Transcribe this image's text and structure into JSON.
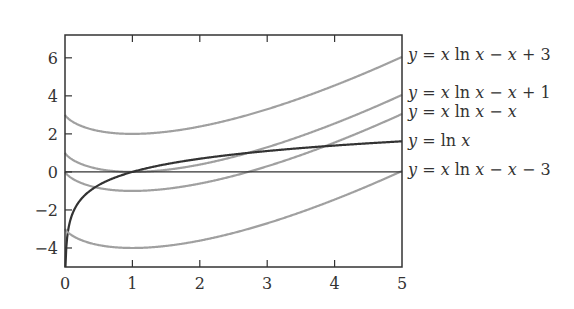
{
  "chart_data": {
    "type": "line",
    "title": "",
    "xlabel": "",
    "ylabel": "",
    "xlim": [
      0,
      5
    ],
    "ylim": [
      -5,
      7.2
    ],
    "xticks": [
      0,
      1,
      2,
      3,
      4,
      5
    ],
    "yticks": [
      -4,
      -2,
      0,
      2,
      4,
      6
    ],
    "xtick_labels": [
      "0",
      "1",
      "2",
      "3",
      "4",
      "5"
    ],
    "ytick_labels": [
      "−4",
      "−2",
      "0",
      "2",
      "4",
      "6"
    ],
    "grid": false,
    "legend_position": "right, inline labels at x=5",
    "series": [
      {
        "name": "y = x ln x − x + 3",
        "color": "#a0a0a0",
        "expr": "x*ln(x)-x+3",
        "x": [
          0,
          0.5,
          1,
          2,
          3,
          4,
          5
        ],
        "values": [
          3,
          2.15,
          2,
          1.39,
          2.3,
          4.55,
          6.05
        ]
      },
      {
        "name": "y = x ln x − x + 1",
        "color": "#a0a0a0",
        "expr": "x*ln(x)-x+1",
        "x": [
          0,
          0.5,
          1,
          2,
          3,
          4,
          5
        ],
        "values": [
          1,
          0.15,
          0,
          -0.61,
          0.3,
          2.55,
          4.05
        ]
      },
      {
        "name": "y = x ln x − x",
        "color": "#a0a0a0",
        "expr": "x*ln(x)-x",
        "x": [
          0,
          0.5,
          1,
          2,
          3,
          4,
          5
        ],
        "values": [
          0,
          -0.85,
          -1,
          -0.61,
          0.3,
          1.55,
          3.05
        ]
      },
      {
        "name": "y = ln x",
        "color": "#333333",
        "expr": "ln(x)",
        "x": [
          0.007,
          0.5,
          1,
          2,
          3,
          4,
          5
        ],
        "values": [
          -5,
          -0.69,
          0,
          0.69,
          1.1,
          1.39,
          1.61
        ]
      },
      {
        "name": "y = x ln x − x − 3",
        "color": "#a0a0a0",
        "expr": "x*ln(x)-x-3",
        "x": [
          0,
          0.5,
          1,
          2,
          3,
          4,
          5
        ],
        "values": [
          -3,
          -3.85,
          -4,
          -3.61,
          -2.7,
          -1.45,
          0.05
        ]
      },
      {
        "name": "y = 0",
        "color": "#333333",
        "expr": "0",
        "x": [
          0,
          5
        ],
        "values": [
          0,
          0
        ]
      }
    ],
    "labels": [
      {
        "text_parts": [
          "y",
          " = ",
          "x",
          " ln ",
          "x",
          " − ",
          "x",
          " + 3"
        ],
        "y_at": 6.05
      },
      {
        "text_parts": [
          "y",
          " = ",
          "x",
          " ln ",
          "x",
          " − ",
          "x",
          " + 1"
        ],
        "y_at": 4.05
      },
      {
        "text_parts": [
          "y",
          " = ",
          "x",
          " ln ",
          "x",
          " − ",
          "x",
          ""
        ],
        "y_at": 3.05
      },
      {
        "text_parts": [
          "y",
          " = ",
          "",
          " ln ",
          "x",
          "",
          "",
          ""
        ],
        "y_at": 1.61
      },
      {
        "text_parts": [
          "y",
          " = ",
          "x",
          " ln ",
          "x",
          " − ",
          "x",
          " − 3"
        ],
        "y_at": 0.05
      }
    ]
  },
  "labels": {
    "l0": "y = x ln x − x + 3",
    "l1": "y = x ln x − x + 1",
    "l2": "y = x ln x − x",
    "l3": "y = ln x",
    "l4": "y = x ln x − x − 3"
  }
}
